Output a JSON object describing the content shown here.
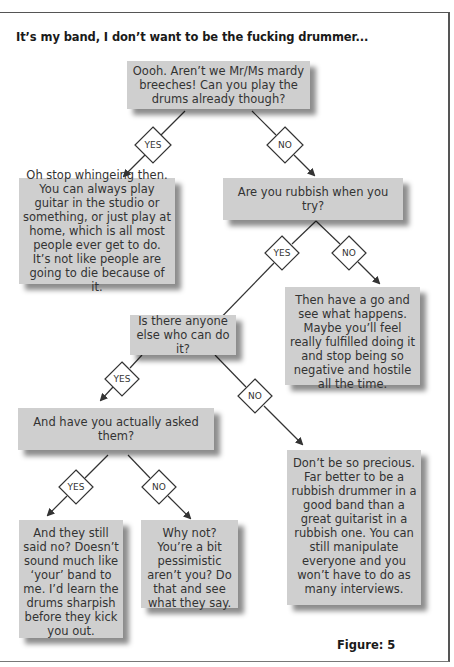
{
  "title": "It’s my band, I don’t want to be the fucking drummer...",
  "figure_label": "Figure: 5",
  "nodes": {
    "q1": "Oooh. Aren’t we Mr/Ms mardy breeches! Can you play the drums already though?",
    "a_play": "Oh stop whingeing then. You can always play guitar in the studio or something, or just play at home, which is all most people ever get to do. It’s not like people are going to die because of it.",
    "q2": "Are you rubbish when you try?",
    "a_not_rubbish": "Then have a go and see what happens. Maybe you’ll feel really fulfilled doing it and stop being so negative and hostile all the time.",
    "q3": "Is there anyone else who can do it?",
    "a_no_one": "Don’t be so precious. Far better to be a rubbish drummer in a good band than a great guitarist in a rubbish one. You can still manipulate everyone and you won’t have to do as many interviews.",
    "q4": "And have you actually asked them?",
    "a_asked": "And they still said no? Doesn’t sound much like ‘your’ band to me. I’d learn the drums sharpish before they kick you out.",
    "a_not_asked": "Why not? You’re a bit pessimistic aren’t you? Do that and see what they say."
  },
  "decisions": {
    "d1_yes": "YES",
    "d1_no": "NO",
    "d2_yes": "YES",
    "d2_no": "NO",
    "d3_yes": "YES",
    "d3_no": "NO",
    "d4_yes": "YES",
    "d4_no": "NO"
  },
  "colors": {
    "box_fill": "#cfcfcf",
    "line": "#333333",
    "text": "#333333"
  }
}
